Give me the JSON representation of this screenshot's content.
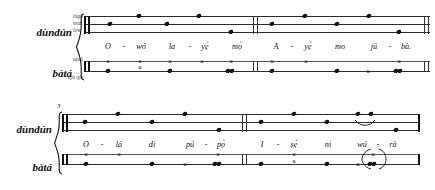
{
  "systems": [
    {
      "id": "system-1",
      "measure_number": "",
      "staves": [
        {
          "id": "dundun-1",
          "instrument": "dùndún",
          "pitch_labels": [
            "high",
            "mid",
            "low"
          ],
          "lines": 3,
          "clef": "thick-double-bar",
          "notes": [
            {
              "x": 110,
              "line": "mid"
            },
            {
              "x": 139,
              "line": "high"
            },
            {
              "x": 167,
              "line": "mid"
            },
            {
              "x": 199,
              "line": "high"
            },
            {
              "x": 231,
              "line": "low"
            },
            {
              "x": 272,
              "line": "mid"
            },
            {
              "x": 305,
              "line": "high"
            },
            {
              "x": 337,
              "line": "mid"
            },
            {
              "x": 369,
              "line": "high"
            },
            {
              "x": 399,
              "line": "low"
            }
          ],
          "slurs": []
        },
        {
          "id": "bata-1",
          "instrument": "bàtá",
          "pitch_labels": [
            "ṣáṣá",
            "ọjú ọ̀jọ̀"
          ],
          "lines": 2,
          "clef": "thick-double-bar",
          "notes": [
            {
              "x": 108,
              "line": "top",
              "head": "x"
            },
            {
              "x": 108,
              "line": "bottom",
              "head": "round"
            },
            {
              "x": 140,
              "line": "top",
              "head": "x"
            },
            {
              "x": 140,
              "line": "bottom",
              "head": "x"
            },
            {
              "x": 170,
              "line": "top",
              "head": "x"
            },
            {
              "x": 170,
              "line": "bottom",
              "head": "round"
            },
            {
              "x": 202,
              "line": "top",
              "head": "x"
            },
            {
              "x": 231,
              "line": "top",
              "head": "x"
            },
            {
              "x": 231,
              "line": "bottom",
              "head": "round"
            },
            {
              "x": 272,
              "line": "top",
              "head": "x"
            },
            {
              "x": 272,
              "line": "bottom",
              "head": "round"
            },
            {
              "x": 306,
              "line": "top",
              "head": "x"
            },
            {
              "x": 337,
              "line": "bottom",
              "head": "round"
            },
            {
              "x": 368,
              "line": "bottom",
              "head": "x"
            },
            {
              "x": 399,
              "line": "top",
              "head": "x"
            },
            {
              "x": 399,
              "line": "bottom",
              "head": "round"
            }
          ],
          "slurs": []
        }
      ],
      "lyrics": [
        {
          "x": 108,
          "text": "O"
        },
        {
          "x": 124,
          "text": "-",
          "hyphen": true
        },
        {
          "x": 141,
          "text": "wó"
        },
        {
          "x": 172,
          "text": "la"
        },
        {
          "x": 190,
          "text": "-",
          "hyphen": true
        },
        {
          "x": 205,
          "text": "yẹ̀"
        },
        {
          "x": 237,
          "text": "mọ̀"
        },
        {
          "x": 276,
          "text": "A"
        },
        {
          "x": 292,
          "text": "-",
          "hyphen": true
        },
        {
          "x": 308,
          "text": "yẹ̀"
        },
        {
          "x": 340,
          "text": "mo"
        },
        {
          "x": 374,
          "text": "jú"
        },
        {
          "x": 390,
          "text": "-",
          "hyphen": true
        },
        {
          "x": 405,
          "text": "bà."
        }
      ],
      "barlines": [
        {
          "x": 84,
          "type": "thick"
        },
        {
          "x": 88,
          "type": "thick"
        },
        {
          "x": 253,
          "type": "light"
        },
        {
          "x": 257,
          "type": "light"
        },
        {
          "x": 424,
          "type": "light"
        },
        {
          "x": 428,
          "type": "light"
        }
      ]
    },
    {
      "id": "system-2",
      "measure_number": "3",
      "staves": [
        {
          "id": "dundun-2",
          "instrument": "dùndún",
          "pitch_labels": [],
          "lines": 3,
          "clef": "thick-double-bar",
          "notes": [
            {
              "x": 85,
              "line": "mid"
            },
            {
              "x": 118,
              "line": "high"
            },
            {
              "x": 152,
              "line": "mid"
            },
            {
              "x": 185,
              "line": "high"
            },
            {
              "x": 219,
              "line": "low"
            },
            {
              "x": 261,
              "line": "mid"
            },
            {
              "x": 294,
              "line": "high"
            },
            {
              "x": 327,
              "line": "mid"
            },
            {
              "x": 358,
              "line": "high"
            },
            {
              "x": 371,
              "line": "high"
            },
            {
              "x": 396,
              "line": "low"
            }
          ],
          "slurs": [
            {
              "x1": 356,
              "x2": 374,
              "y": 128
            }
          ]
        },
        {
          "id": "bata-2",
          "instrument": "bàtá",
          "pitch_labels": [],
          "lines": 2,
          "clef": "thick-double-bar",
          "notes": [
            {
              "x": 86,
              "line": "top",
              "head": "x"
            },
            {
              "x": 86,
              "line": "bottom",
              "head": "round"
            },
            {
              "x": 119,
              "line": "top",
              "head": "x"
            },
            {
              "x": 152,
              "line": "bottom",
              "head": "round"
            },
            {
              "x": 185,
              "line": "bottom",
              "head": "x"
            },
            {
              "x": 218,
              "line": "top",
              "head": "x"
            },
            {
              "x": 218,
              "line": "bottom",
              "head": "round"
            },
            {
              "x": 261,
              "line": "bottom",
              "head": "round"
            },
            {
              "x": 294,
              "line": "top",
              "head": "x"
            },
            {
              "x": 294,
              "line": "bottom",
              "head": "x"
            },
            {
              "x": 327,
              "line": "bottom",
              "head": "round"
            },
            {
              "x": 358,
              "line": "bottom",
              "head": "x"
            },
            {
              "x": 373,
              "line": "top",
              "head": "x"
            },
            {
              "x": 373,
              "line": "bottom",
              "head": "round"
            }
          ],
          "slurs": [
            {
              "x1": 352,
              "x2": 382,
              "y": 172
            }
          ]
        }
      ],
      "lyrics": [
        {
          "x": 86,
          "text": "O"
        },
        {
          "x": 102,
          "text": "-",
          "hyphen": true
        },
        {
          "x": 119,
          "text": "lá"
        },
        {
          "x": 152,
          "text": "di"
        },
        {
          "x": 190,
          "text": "pú"
        },
        {
          "x": 206,
          "text": "-",
          "hyphen": true
        },
        {
          "x": 221,
          "text": "pọ̀"
        },
        {
          "x": 262,
          "text": "I"
        },
        {
          "x": 278,
          "text": "-",
          "hyphen": true
        },
        {
          "x": 294,
          "text": "ṣẹ́"
        },
        {
          "x": 328,
          "text": "ni"
        },
        {
          "x": 362,
          "text": "wú"
        },
        {
          "x": 378,
          "text": "-",
          "hyphen": true
        },
        {
          "x": 393,
          "text": "rà"
        }
      ],
      "barlines": [
        {
          "x": 62,
          "type": "thick"
        },
        {
          "x": 66,
          "type": "thick"
        },
        {
          "x": 242,
          "type": "light"
        },
        {
          "x": 246,
          "type": "light"
        },
        {
          "x": 418,
          "type": "thick"
        }
      ]
    }
  ],
  "colors": {
    "ink": "#111111",
    "staff": "#2b2b2b",
    "pitch_label": "#3a3a3a",
    "background": "#ffffff"
  }
}
